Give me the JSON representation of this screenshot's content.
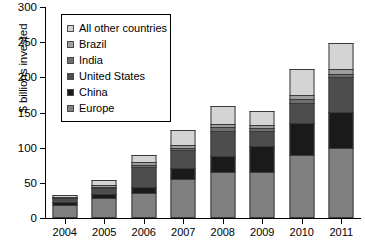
{
  "chart_data": {
    "type": "bar",
    "stacked": true,
    "title": "",
    "xlabel": "",
    "ylabel": "$ billions invested",
    "categories": [
      "2004",
      "2005",
      "2006",
      "2007",
      "2008",
      "2009",
      "2010",
      "2011"
    ],
    "ylim": [
      0,
      300
    ],
    "yticks": [
      0,
      50,
      100,
      150,
      200,
      250,
      300
    ],
    "grid": false,
    "legend_position": "upper-left-inside",
    "series": [
      {
        "name": "Europe",
        "color": "#808080",
        "values": [
          18,
          28,
          36,
          56,
          65,
          66,
          90,
          99
        ]
      },
      {
        "name": "China",
        "color": "#1a1a1a",
        "values": [
          6,
          8,
          10,
          16,
          25,
          38,
          46,
          53
        ]
      },
      {
        "name": "United States",
        "color": "#4d4d4d",
        "values": [
          8,
          9,
          29,
          28,
          37,
          23,
          31,
          51
        ]
      },
      {
        "name": "India",
        "color": "#6e6e6e",
        "values": [
          2,
          4,
          5,
          4,
          6,
          5,
          7,
          6
        ]
      },
      {
        "name": "Brazil",
        "color": "#9e9e9e",
        "values": [
          1,
          3,
          5,
          5,
          7,
          6,
          7,
          9
        ]
      },
      {
        "name": "All other countries",
        "color": "#d4d4d4",
        "values": [
          4,
          9,
          12,
          23,
          26,
          22,
          38,
          38
        ]
      }
    ],
    "totals": [
      39,
      61,
      97,
      132,
      166,
      160,
      219,
      256
    ],
    "legend_entries": [
      {
        "label": "All other countries",
        "color": "#d4d4d4"
      },
      {
        "label": "Brazil",
        "color": "#9e9e9e"
      },
      {
        "label": "India",
        "color": "#6e6e6e"
      },
      {
        "label": "United States",
        "color": "#4d4d4d"
      },
      {
        "label": "China",
        "color": "#1a1a1a"
      },
      {
        "label": "Europe",
        "color": "#808080"
      }
    ]
  }
}
